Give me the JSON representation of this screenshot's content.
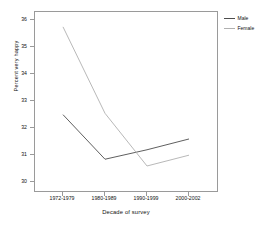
{
  "chart_data": {
    "type": "line",
    "title": "",
    "xlabel": "Decade of survey",
    "ylabel": "Percent very happy",
    "categories": [
      "1972-1979",
      "1980-1989",
      "1990-1999",
      "2000-2002"
    ],
    "ylim": [
      29.6,
      36.3
    ],
    "yticks": [
      30,
      31,
      32,
      33,
      34,
      35,
      36
    ],
    "ytick_labels": [
      "30",
      "31",
      "32",
      "33",
      "34",
      "35",
      "36"
    ],
    "grid": false,
    "legend_position": "right",
    "series": [
      {
        "name": "Male",
        "color": "#4d4d4d",
        "values": [
          32.5,
          30.85,
          31.2,
          31.6
        ]
      },
      {
        "name": "Female",
        "color": "#b0b0b0",
        "values": [
          35.75,
          32.55,
          30.6,
          31.0
        ]
      }
    ]
  },
  "legend": {
    "items": [
      {
        "label": "Male",
        "color": "#4d4d4d"
      },
      {
        "label": "Female",
        "color": "#b0b0b0"
      }
    ]
  },
  "axes": {
    "frame_color": "#9a9a9a"
  }
}
